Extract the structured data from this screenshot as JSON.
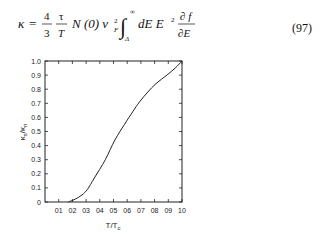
{
  "equation": {
    "lhs": "κ",
    "eq": "=",
    "frac1": {
      "num": "4",
      "den": "3"
    },
    "frac2": {
      "num": "τ",
      "den": "T"
    },
    "term": "N (0) v",
    "sub_F": "F",
    "sup_2": "2",
    "int_upper": "∞",
    "int_lower": "Δ",
    "integrand": "dE E",
    "integrand_sup": "2",
    "deriv": {
      "num": "∂ f",
      "den": "∂E"
    },
    "number": "(97)"
  },
  "chart_data": {
    "type": "line",
    "title": "",
    "xlabel": "T/T_c",
    "ylabel": "κ_s/κ_n",
    "xlim": [
      0,
      1.0
    ],
    "ylim": [
      0,
      1.0
    ],
    "grid": false,
    "legend": null,
    "x_tick_labels": [
      "01",
      "02",
      "03",
      "04",
      "05",
      "06",
      "07",
      "08",
      "09",
      "10"
    ],
    "y_tick_labels": [
      "0",
      "0.1",
      "0.2",
      "0.3",
      "0.4",
      "0.5",
      "0.6",
      "0.7",
      "0.8",
      "0.9",
      "1.0"
    ],
    "series": [
      {
        "name": "κs/κn",
        "x": [
          0.17,
          0.22,
          0.27,
          0.31,
          0.36,
          0.44,
          0.51,
          0.58,
          0.64,
          0.69,
          0.75,
          0.81,
          0.89,
          0.95,
          1.0
        ],
        "y": [
          0.0,
          0.02,
          0.05,
          0.09,
          0.17,
          0.3,
          0.44,
          0.55,
          0.64,
          0.71,
          0.78,
          0.84,
          0.9,
          0.95,
          1.0
        ]
      }
    ]
  }
}
